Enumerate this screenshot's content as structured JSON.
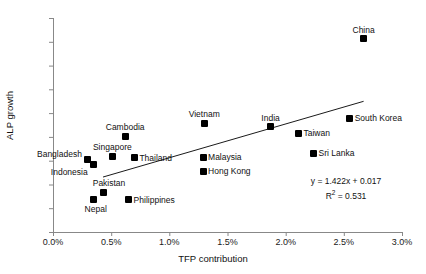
{
  "chart_data": {
    "type": "scatter",
    "title": "",
    "xlabel": "TFP contribution",
    "ylabel": "ALP growth",
    "xlim": [
      0.0,
      3.0
    ],
    "ylim": [
      0,
      9
    ],
    "xticks": [
      "0.0%",
      "0.5%",
      "1.0%",
      "1.5%",
      "2.0%",
      "2.5%",
      "3.0%"
    ],
    "xtick_values": [
      0.0,
      0.5,
      1.0,
      1.5,
      2.0,
      2.5,
      3.0
    ],
    "yticks": [
      "0%",
      "1%",
      "2%",
      "3%",
      "4%",
      "5%",
      "6%",
      "7%",
      "8%",
      "9%"
    ],
    "ytick_values": [
      0,
      1,
      2,
      3,
      4,
      5,
      6,
      7,
      8,
      9
    ],
    "grid": false,
    "legend": null,
    "points": [
      {
        "label": "Bangladesh",
        "x": 0.3,
        "y": 3.05,
        "label_pos": "left",
        "label_dx": -6,
        "label_dy": -5
      },
      {
        "label": "Indonesia",
        "x": 0.35,
        "y": 2.83,
        "label_pos": "left",
        "label_dx": -6,
        "label_dy": 7
      },
      {
        "label": "Nepal",
        "x": 0.35,
        "y": 1.35,
        "label_pos": "below",
        "label_dx": 2,
        "label_dy": 5
      },
      {
        "label": "Pakistan",
        "x": 0.43,
        "y": 1.68,
        "label_pos": "above",
        "label_dx": 6,
        "label_dy": -4
      },
      {
        "label": "Singapore",
        "x": 0.51,
        "y": 3.18,
        "label_pos": "above",
        "label_dx": 0,
        "label_dy": -4
      },
      {
        "label": "Cambodia",
        "x": 0.62,
        "y": 4.03,
        "label_pos": "above",
        "label_dx": 0,
        "label_dy": -4
      },
      {
        "label": "Philippines",
        "x": 0.65,
        "y": 1.35,
        "label_pos": "right",
        "label_dx": 5,
        "label_dy": 0
      },
      {
        "label": "Thailand",
        "x": 0.7,
        "y": 3.12,
        "label_pos": "right",
        "label_dx": 5,
        "label_dy": 0
      },
      {
        "label": "Vietnam",
        "x": 1.3,
        "y": 4.58,
        "label_pos": "above",
        "label_dx": 0,
        "label_dy": -4
      },
      {
        "label": "Malaysia",
        "x": 1.29,
        "y": 3.15,
        "label_pos": "right",
        "label_dx": 5,
        "label_dy": 0
      },
      {
        "label": "Hong Kong",
        "x": 1.29,
        "y": 2.55,
        "label_pos": "right",
        "label_dx": 5,
        "label_dy": 0
      },
      {
        "label": "India",
        "x": 1.87,
        "y": 4.42,
        "label_pos": "above",
        "label_dx": 0,
        "label_dy": -4
      },
      {
        "label": "Taiwan",
        "x": 2.11,
        "y": 4.16,
        "label_pos": "right",
        "label_dx": 5,
        "label_dy": 0
      },
      {
        "label": "Sri Lanka",
        "x": 2.24,
        "y": 3.32,
        "label_pos": "right",
        "label_dx": 5,
        "label_dy": 0
      },
      {
        "label": "China",
        "x": 2.67,
        "y": 8.13,
        "label_pos": "above",
        "label_dx": 0,
        "label_dy": -4
      },
      {
        "label": "South Korea",
        "x": 2.55,
        "y": 4.78,
        "label_pos": "right",
        "label_dx": 5,
        "label_dy": 0
      }
    ],
    "trendline": {
      "slope": 1.422,
      "intercept": 0.017,
      "equation": "y = 1.422x + 0.017",
      "r_squared_label": "R",
      "r_squared_sup": "2",
      "r_squared_value": " = 0.531",
      "x_start": 0.43,
      "x_end": 2.67,
      "color": "#000000"
    }
  },
  "style": {
    "axis_color": "#808080",
    "text_color": "#111111",
    "marker_color": "#000000",
    "background": "#ffffff"
  }
}
